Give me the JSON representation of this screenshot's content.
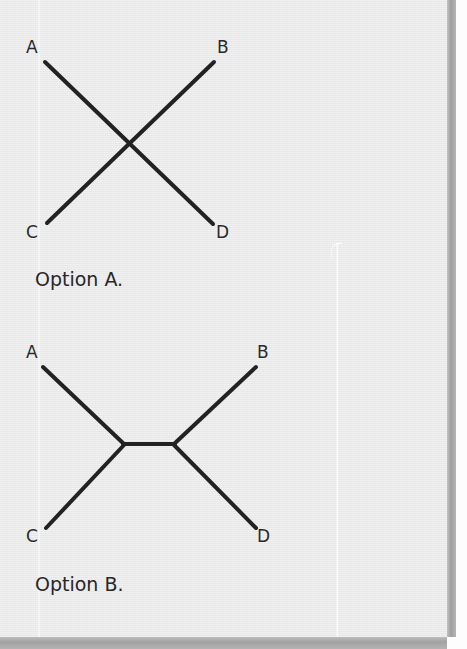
{
  "page": {
    "background_color": "#e9e9e9",
    "edge_shadow_color": "#9e9e9e",
    "stroke_color": "#222222"
  },
  "figures": [
    {
      "id": "option-a",
      "caption": "Option A.",
      "description": "Two straight lines crossing in an X: A to D and C to B",
      "labels": [
        {
          "key": "A",
          "text": "A",
          "x": 30,
          "y": 48
        },
        {
          "key": "B",
          "text": "B",
          "x": 222,
          "y": 48
        },
        {
          "key": "C",
          "text": "C",
          "x": 30,
          "y": 233
        },
        {
          "key": "D",
          "text": "D",
          "x": 221,
          "y": 233
        }
      ],
      "segments": [
        {
          "name": "a-to-d",
          "x1": 45,
          "y1": 62,
          "x2": 213,
          "y2": 224
        },
        {
          "name": "c-to-b",
          "x1": 47,
          "y1": 223,
          "x2": 214,
          "y2": 62
        }
      ],
      "crossing_point": {
        "x": 130,
        "y": 144
      }
    },
    {
      "id": "option-b",
      "caption": "Option B.",
      "description": "Four lines meeting at two vertices joined by a short horizontal bar: A and C meet at the left vertex, B and D meet at the right vertex",
      "labels": [
        {
          "key": "A",
          "text": "A",
          "x": 30,
          "y": 353
        },
        {
          "key": "B",
          "text": "B",
          "x": 261,
          "y": 353
        },
        {
          "key": "C",
          "text": "C",
          "x": 30,
          "y": 537
        },
        {
          "key": "D",
          "text": "D",
          "x": 261,
          "y": 537
        }
      ],
      "segments": [
        {
          "name": "a-to-left-vertex",
          "x1": 43,
          "y1": 367,
          "x2": 124,
          "y2": 444
        },
        {
          "name": "c-to-left-vertex",
          "x1": 46,
          "y1": 528,
          "x2": 124,
          "y2": 445
        },
        {
          "name": "left-vertex-to-right-vertex",
          "x1": 124,
          "y1": 444,
          "x2": 174,
          "y2": 444
        },
        {
          "name": "b-to-right-vertex",
          "x1": 256,
          "y1": 367,
          "x2": 174,
          "y2": 444
        },
        {
          "name": "d-to-right-vertex",
          "x1": 256,
          "y1": 528,
          "x2": 174,
          "y2": 445
        }
      ],
      "vertices": [
        {
          "name": "left-vertex",
          "x": 124,
          "y": 444
        },
        {
          "name": "right-vertex",
          "x": 174,
          "y": 444
        }
      ]
    }
  ]
}
